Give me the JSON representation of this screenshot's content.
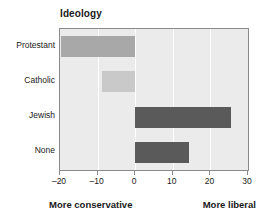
{
  "chart_data": {
    "type": "bar",
    "orientation": "horizontal",
    "title": "Ideology",
    "xlabel": "",
    "ylabel": "",
    "categories": [
      "Protestant",
      "Catholic",
      "Jewish",
      "None"
    ],
    "values": [
      -19.7,
      -8.7,
      25.5,
      14.2
    ],
    "bar_colors": [
      "#a8a8a8",
      "#c9c9c9",
      "#5a5a5a",
      "#5a5a5a"
    ],
    "xlim": [
      -20,
      30
    ],
    "xticks": [
      -20,
      -10,
      0,
      10,
      20,
      30
    ],
    "xtick_labels": [
      "–20",
      "–10",
      "0",
      "10",
      "20",
      "30"
    ],
    "grid": true,
    "gridline_color": "#ffffff",
    "plot_background": "#ebebeb",
    "frame_color": "#8a8a8a",
    "legend": null
  },
  "annotations": {
    "left_caption": "More conservative",
    "right_caption": "More liberal"
  }
}
